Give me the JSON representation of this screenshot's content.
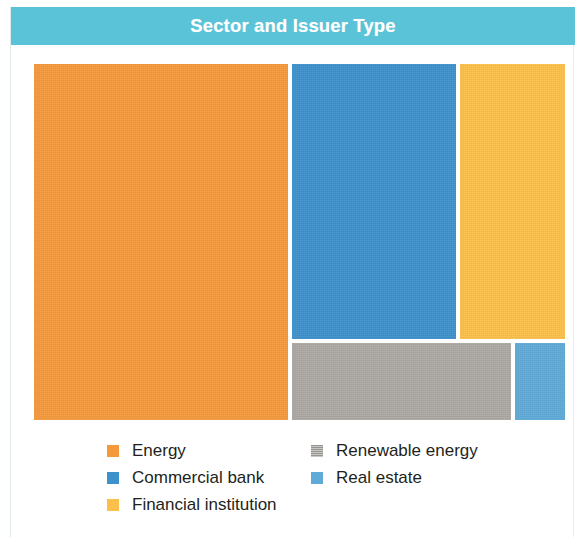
{
  "header": {
    "title": "Sector and Issuer Type",
    "bar_color": "#5bc3d8",
    "text_color": "#ffffff"
  },
  "chart_data": {
    "type": "treemap",
    "title": "Sector and Issuer Type",
    "xlabel": "",
    "ylabel": "",
    "grid": false,
    "legend_position": "bottom",
    "categories": [
      "Energy",
      "Commercial bank",
      "Financial institution",
      "Renewable energy",
      "Real estate"
    ],
    "values": [
      44.9,
      23.0,
      17.8,
      11.4,
      2.9
    ],
    "colors": [
      "#f5993d",
      "#3e92cc",
      "#fbc04a",
      "#aca9a4",
      "#60aad7"
    ],
    "tiles": [
      {
        "label": "Energy",
        "value": 44.9,
        "color": "#f5993d",
        "left": 23,
        "top": 19,
        "width": 254,
        "height": 356
      },
      {
        "label": "Commercial bank",
        "value": 23.0,
        "color": "#3e92cc",
        "left": 281,
        "top": 19,
        "width": 164,
        "height": 275
      },
      {
        "label": "Financial institution",
        "value": 17.8,
        "color": "#fbc04a",
        "left": 449,
        "top": 19,
        "width": 105,
        "height": 275
      },
      {
        "label": "Renewable energy",
        "value": 11.4,
        "color": "#aca9a4",
        "left": 281,
        "top": 298,
        "width": 219,
        "height": 77
      },
      {
        "label": "Real estate",
        "value": 2.9,
        "color": "#60aad7",
        "left": 504,
        "top": 298,
        "width": 50,
        "height": 77
      }
    ]
  },
  "legend": {
    "left_column": [
      {
        "label": "Energy",
        "color": "#f5993d",
        "grain": false
      },
      {
        "label": "Commercial bank",
        "color": "#3e92cc",
        "grain": false
      },
      {
        "label": "Financial institution",
        "color": "#fbc04a",
        "grain": false
      }
    ],
    "right_column": [
      {
        "label": "Renewable energy",
        "color": "#aca9a4",
        "grain": true
      },
      {
        "label": "Real estate",
        "color": "#60aad7",
        "grain": false
      }
    ]
  }
}
